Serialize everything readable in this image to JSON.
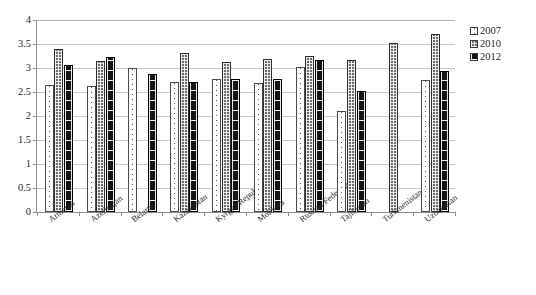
{
  "chart_data": {
    "type": "bar",
    "title": "",
    "xlabel": "",
    "ylabel": "",
    "ylim": [
      0,
      4
    ],
    "ytick_step": 0.5,
    "yticks": [
      "4",
      "3.5",
      "3",
      "2.5",
      "2",
      "1.5",
      "1",
      "0.5",
      "0"
    ],
    "grid": true,
    "legend_position": "right",
    "categories": [
      "Armenia",
      "Azerbaijan",
      "Belarus",
      "Kazakhstan",
      "Kyrgyz Republic",
      "Moldova",
      "Russian Federation",
      "Tajikistan",
      "Turkmenistan",
      "Uzbekistan"
    ],
    "series": [
      {
        "name": "2007",
        "fill": "white-dotted",
        "color": "#ffffff",
        "values": [
          2.65,
          2.63,
          3.0,
          2.7,
          2.77,
          2.68,
          3.02,
          2.11,
          null,
          2.74
        ]
      },
      {
        "name": "2010",
        "fill": "grey-checker",
        "color": "#6f6f6f",
        "values": [
          3.4,
          3.15,
          null,
          3.31,
          3.12,
          3.18,
          3.25,
          3.16,
          3.52,
          3.7
        ]
      },
      {
        "name": "2012",
        "fill": "black-dashed",
        "color": "#141414",
        "values": [
          3.07,
          3.22,
          2.87,
          2.7,
          2.78,
          2.77,
          3.16,
          2.52,
          null,
          2.93
        ]
      }
    ]
  },
  "legend": {
    "items": [
      {
        "label": "2007"
      },
      {
        "label": "2010"
      },
      {
        "label": "2012"
      }
    ]
  },
  "title_sliver": {
    "text": ""
  }
}
